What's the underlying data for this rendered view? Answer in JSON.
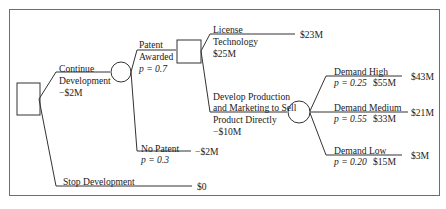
{
  "diagram": {
    "type": "decision-tree",
    "colors": {
      "line": "#333333",
      "frame": "#6e6e6e",
      "text": "#222222"
    },
    "root": {
      "node_type": "decision",
      "branches": [
        {
          "label_line1": "Continue",
          "label_line2": "Development",
          "cost": "−$2M",
          "node_type": "chance",
          "branches": [
            {
              "label_line1": "Patent",
              "label_line2": "Awarded",
              "prob": "p = 0.7",
              "node_type": "decision",
              "branches": [
                {
                  "label_line1": "License",
                  "label_line2": "Technology",
                  "value": "$25M",
                  "payoff": "$23M"
                },
                {
                  "label_line1": "Develop Production",
                  "label_line2": "and Marketing to Sell",
                  "label_line3": "Product Directly",
                  "cost": "−$10M",
                  "node_type": "chance",
                  "branches": [
                    {
                      "label": "Demand High",
                      "prob": "p = 0.25",
                      "value": "$55M",
                      "payoff": "$43M"
                    },
                    {
                      "label": "Demand Medium",
                      "prob": "p = 0.55",
                      "value": "$33M",
                      "payoff": "$21M"
                    },
                    {
                      "label": "Demand Low",
                      "prob": "p = 0.20",
                      "value": "$15M",
                      "payoff": "$3M"
                    }
                  ]
                }
              ]
            },
            {
              "label": "No Patent",
              "prob": "p = 0.3",
              "payoff": "−$2M"
            }
          ]
        },
        {
          "label": "Stop Development",
          "payoff": "$0"
        }
      ]
    }
  }
}
